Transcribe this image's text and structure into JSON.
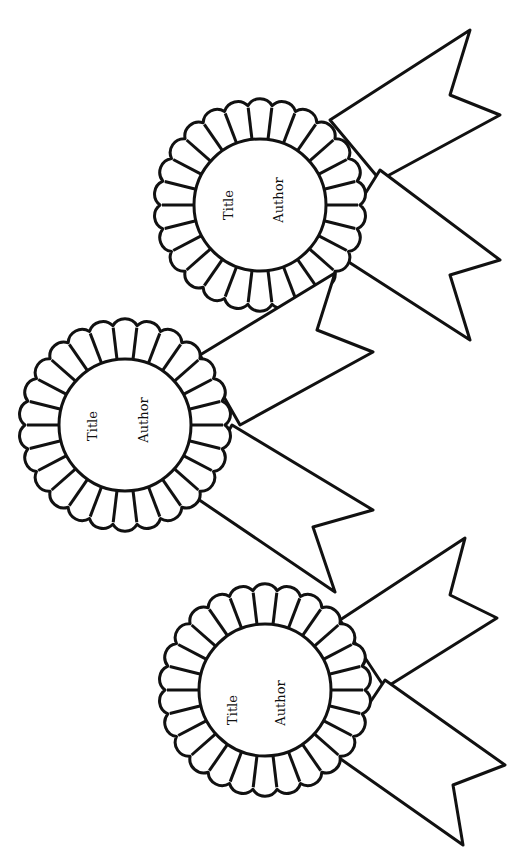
{
  "page": {
    "background": "#ffffff",
    "ink": "#111111"
  },
  "rosettes": [
    {
      "id": "top",
      "cx": 260,
      "cy": 205,
      "outer_r": 100,
      "inner_r": 66,
      "petals": 26,
      "title_label": "Title",
      "author_label": "Author",
      "title_pos": [
        233,
        205
      ],
      "author_pos": [
        283,
        200
      ],
      "ribbon_upper": [
        [
          330,
          120
        ],
        [
          470,
          30
        ],
        [
          450,
          95
        ],
        [
          500,
          115
        ],
        [
          380,
          180
        ]
      ],
      "ribbon_lower": [
        [
          380,
          170
        ],
        [
          500,
          260
        ],
        [
          450,
          275
        ],
        [
          470,
          340
        ],
        [
          330,
          250
        ]
      ]
    },
    {
      "id": "middle",
      "cx": 125,
      "cy": 425,
      "outer_r": 100,
      "inner_r": 66,
      "petals": 26,
      "title_label": "Title",
      "author_label": "Author",
      "title_pos": [
        97,
        426
      ],
      "author_pos": [
        148,
        420
      ],
      "ribbon_upper": [
        [
          200,
          355
        ],
        [
          335,
          273
        ],
        [
          317,
          330
        ],
        [
          373,
          352
        ],
        [
          240,
          425
        ]
      ],
      "ribbon_lower": [
        [
          232,
          425
        ],
        [
          373,
          510
        ],
        [
          313,
          527
        ],
        [
          335,
          592
        ],
        [
          192,
          495
        ]
      ]
    },
    {
      "id": "bottom",
      "cx": 265,
      "cy": 690,
      "outer_r": 100,
      "inner_r": 66,
      "petals": 26,
      "title_label": "Title",
      "author_label": "Author",
      "title_pos": [
        237,
        710
      ],
      "author_pos": [
        285,
        703
      ],
      "ribbon_upper": [
        [
          340,
          620
        ],
        [
          465,
          538
        ],
        [
          450,
          595
        ],
        [
          497,
          618
        ],
        [
          385,
          688
        ]
      ],
      "ribbon_lower": [
        [
          385,
          680
        ],
        [
          505,
          765
        ],
        [
          453,
          785
        ],
        [
          463,
          845
        ],
        [
          335,
          755
        ]
      ]
    }
  ]
}
